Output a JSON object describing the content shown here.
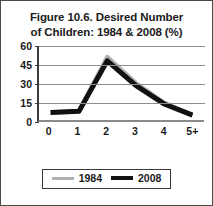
{
  "figure": {
    "title_line_1": "Figure 10.6. Desired Number",
    "title_line_2": "of Children: 1984 & 2008 (%)",
    "border_color": "#4a4a4a",
    "background_color": "#ffffff"
  },
  "legend": {
    "position": "bottom-center",
    "entries": [
      {
        "label": "1984",
        "color": "#b0b0b0",
        "swatch": "gray-line-swatch"
      },
      {
        "label": "2008",
        "color": "#111111",
        "swatch": "black-line-swatch"
      }
    ]
  },
  "chart_data": {
    "type": "line",
    "title": "Figure 10.6. Desired Number of Children: 1984 & 2008 (%)",
    "xlabel": "",
    "ylabel": "",
    "categories": [
      "0",
      "1",
      "2",
      "3",
      "4",
      "5+"
    ],
    "yticks": [
      0,
      15,
      30,
      45,
      60
    ],
    "ylim": [
      0,
      60
    ],
    "grid": true,
    "legend_position": "bottom-center",
    "series": [
      {
        "name": "1984",
        "color": "#b0b0b0",
        "values": [
          6,
          7,
          51,
          30,
          14,
          4
        ]
      },
      {
        "name": "2008",
        "color": "#111111",
        "values": [
          6,
          7,
          48,
          28,
          13,
          4
        ]
      }
    ]
  }
}
